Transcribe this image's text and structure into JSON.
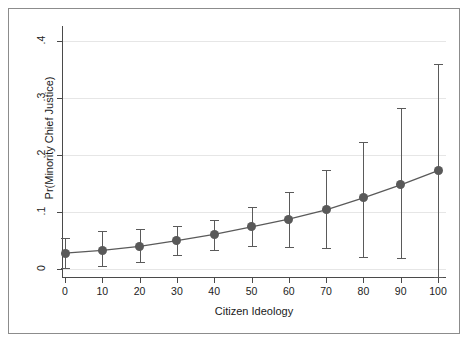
{
  "figure": {
    "background_color": "#ffffff",
    "frame_color": "#8c8c8c",
    "marker_color": "#595959",
    "line_color": "#5a5a5a",
    "grid_color": "#e6e6e6"
  },
  "chart_data": {
    "type": "line",
    "title": "",
    "subtitle": "",
    "xlabel": "Citizen Ideology",
    "ylabel": "Pr(Minority Chief Justice)",
    "xlim": [
      0,
      100
    ],
    "ylim": [
      0,
      0.4
    ],
    "xticks": [
      0,
      10,
      20,
      30,
      40,
      50,
      60,
      70,
      80,
      90,
      100
    ],
    "xtick_labels": [
      "0",
      "10",
      "20",
      "30",
      "40",
      "50",
      "60",
      "70",
      "80",
      "90",
      "100"
    ],
    "yticks": [
      0,
      0.1,
      0.2,
      0.3,
      0.4
    ],
    "ytick_labels": [
      "0",
      ".1",
      ".2",
      ".3",
      ".4"
    ],
    "grid": "horizontal",
    "legend": "none",
    "marker": "filled-circle",
    "error_bars": "vertical-capped",
    "x": [
      0,
      10,
      20,
      30,
      40,
      50,
      60,
      70,
      80,
      90,
      100
    ],
    "y": [
      0.027,
      0.032,
      0.039,
      0.049,
      0.06,
      0.073,
      0.087,
      0.103,
      0.124,
      0.147,
      0.172
    ],
    "y_lower": [
      0.001,
      0.005,
      0.012,
      0.024,
      0.033,
      0.039,
      0.038,
      0.036,
      0.02,
      0.018,
      -0.015
    ],
    "y_upper": [
      0.054,
      0.066,
      0.069,
      0.074,
      0.085,
      0.108,
      0.135,
      0.174,
      0.222,
      0.283,
      0.36
    ],
    "series": [
      {
        "name": "Predicted probability",
        "values": [
          0.027,
          0.032,
          0.039,
          0.049,
          0.06,
          0.073,
          0.087,
          0.103,
          0.124,
          0.147,
          0.172
        ]
      }
    ],
    "annotations": []
  }
}
